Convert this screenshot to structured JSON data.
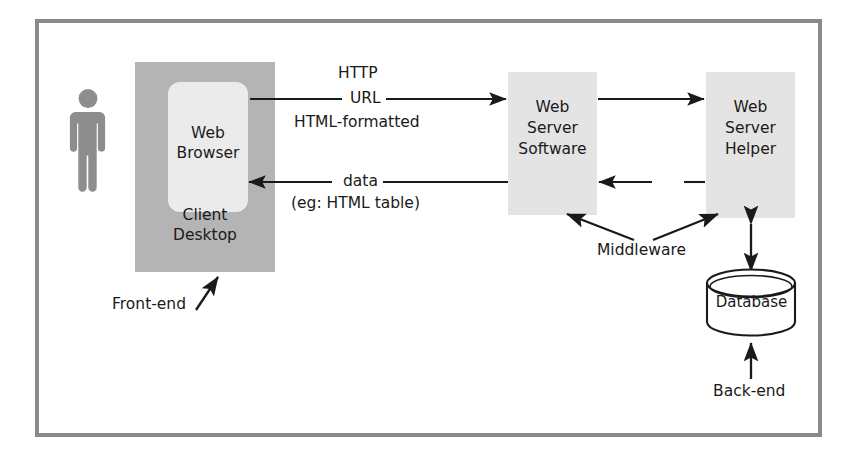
{
  "diagram": {
    "frame": {
      "border_color": "#8a8a8a"
    },
    "actor": {
      "name": "user-figure",
      "color": "#8d8d8d"
    },
    "nodes": {
      "client_desktop": {
        "label": "Client\nDesktop",
        "line1": "Client",
        "line2": "Desktop",
        "fill": "#b4b4b4"
      },
      "web_browser": {
        "label": "Web\nBrowser",
        "line1": "Web",
        "line2": "Browser",
        "fill": "#ebebeb"
      },
      "web_server_software": {
        "line1": "Web",
        "line2": "Server",
        "line3": "Software",
        "fill": "#e4e4e4"
      },
      "web_server_helper": {
        "line1": "Web",
        "line2": "Server",
        "line3": "Helper",
        "fill": "#e4e4e4"
      },
      "database": {
        "label": "Database",
        "fill": "#ffffff"
      }
    },
    "edges": {
      "request": {
        "line1": "HTTP",
        "line2": "URL",
        "line3": "HTML-formatted",
        "direction": "browser-to-server"
      },
      "response": {
        "line1": "data",
        "line2": "(eg: HTML table)",
        "direction": "server-to-browser"
      },
      "server_to_helper": {
        "label": "",
        "direction": "software-to-helper"
      },
      "helper_to_server": {
        "label": "HTML",
        "direction": "helper-to-software"
      },
      "db_link": {
        "label": "",
        "direction": "bidirectional"
      },
      "backend_arrow": {
        "label": "Back-end",
        "direction": "up"
      }
    },
    "annotations": {
      "middleware": "Middleware",
      "front_end": "Front-end",
      "back_end": "Back-end"
    },
    "colors": {
      "stroke": "#1a1a1a",
      "frame": "#8a8a8a",
      "shade_dark": "#b4b4b4",
      "shade_light": "#e4e4e4",
      "shade_lighter": "#ebebeb"
    }
  }
}
